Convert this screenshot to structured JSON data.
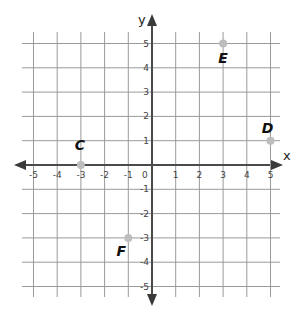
{
  "chart_data": {
    "type": "scatter",
    "title": "",
    "xlabel": "x",
    "ylabel": "y",
    "xlim": [
      -5,
      5
    ],
    "ylim": [
      -5,
      5
    ],
    "grid": true,
    "x_ticks": [
      -5,
      -4,
      -3,
      -2,
      -1,
      0,
      1,
      2,
      3,
      4,
      5
    ],
    "y_ticks": [
      -5,
      -4,
      -3,
      -2,
      -1,
      1,
      2,
      3,
      4,
      5
    ],
    "points": [
      {
        "label": "C",
        "x": -3,
        "y": 0
      },
      {
        "label": "D",
        "x": 5,
        "y": 1
      },
      {
        "label": "E",
        "x": 3,
        "y": 5
      },
      {
        "label": "F",
        "x": -1,
        "y": -3
      }
    ]
  },
  "axes": {
    "x_name": "x",
    "y_name": "y",
    "origin_label": "0"
  },
  "colors": {
    "grid": "#9a9a9a",
    "axis": "#4a4a4a",
    "point": "#bdbdbd",
    "label": "#111111"
  }
}
